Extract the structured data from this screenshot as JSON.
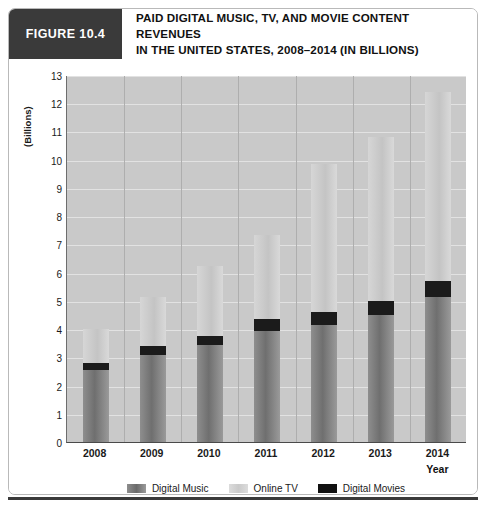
{
  "figure": {
    "tag": "FIGURE 10.4",
    "title_line1": "PAID DIGITAL MUSIC, TV, AND MOVIE CONTENT REVENUES",
    "title_line2": "IN THE UNITED STATES, 2008–2014 (IN BILLIONS)"
  },
  "chart_data": {
    "type": "bar",
    "stacked": true,
    "title": "PAID DIGITAL MUSIC, TV, AND MOVIE CONTENT REVENUES IN THE UNITED STATES, 2008–2014 (IN BILLIONS)",
    "xlabel": "Year",
    "ylabel": "(Billions)",
    "categories": [
      "2008",
      "2009",
      "2010",
      "2011",
      "2012",
      "2013",
      "2014"
    ],
    "series": [
      {
        "name": "Digital Music",
        "color": "#7a7a7a",
        "values": [
          2.55,
          3.1,
          3.45,
          3.95,
          4.15,
          4.5,
          5.15
        ]
      },
      {
        "name": "Digital Movies",
        "color": "#111111",
        "values": [
          0.25,
          0.3,
          0.3,
          0.4,
          0.45,
          0.5,
          0.55
        ]
      },
      {
        "name": "Online TV",
        "color": "#d2d2d2",
        "values": [
          1.2,
          1.75,
          2.5,
          3.0,
          5.25,
          5.8,
          6.7
        ]
      }
    ],
    "totals": [
      4.0,
      5.15,
      6.25,
      7.35,
      9.85,
      10.8,
      12.4
    ],
    "ylim": [
      0,
      13
    ],
    "yticks": [
      "13",
      "12",
      "11",
      "10",
      "9",
      "8",
      "7",
      "6",
      "5",
      "4",
      "3",
      "2",
      "1",
      "0"
    ],
    "ytick_values": [
      13,
      12,
      11,
      10,
      9,
      8,
      7,
      6,
      5,
      4,
      3,
      2,
      1,
      0
    ],
    "grid": true,
    "legend_position": "bottom",
    "legend": [
      "Digital Music",
      "Online TV",
      "Digital Movies"
    ]
  }
}
